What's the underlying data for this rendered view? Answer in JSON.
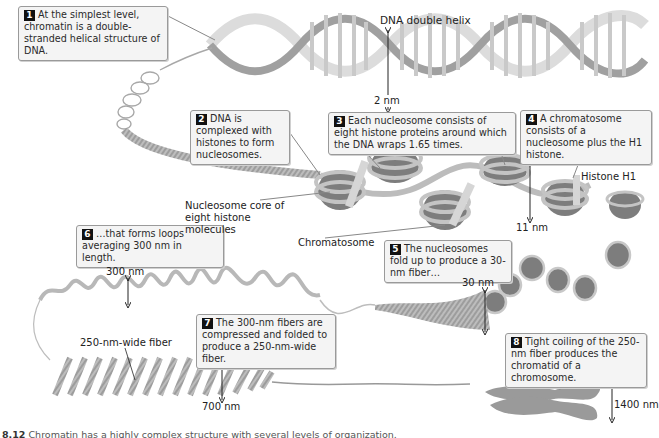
{
  "figure": {
    "caption_number": "8.12",
    "caption_text": "Chromatin has a highly complex structure with several levels of organization."
  },
  "callouts": [
    {
      "step": "1",
      "text": "At the simplest level, chromatin is a double-stranded helical structure of DNA."
    },
    {
      "step": "2",
      "text": "DNA is complexed with histones to form nucleosomes."
    },
    {
      "step": "3",
      "text": "Each nucleosome consists of eight histone proteins around which the DNA wraps 1.65 times."
    },
    {
      "step": "4",
      "text": "A chromatosome consists of a nucleosome plus the H1 histone."
    },
    {
      "step": "5",
      "text": "The nucleosomes fold up to produce a 30-nm fiber…"
    },
    {
      "step": "6",
      "text": "…that forms loops averaging 300 nm in length."
    },
    {
      "step": "7",
      "text": "The 300-nm fibers are compressed and folded to produce a 250-nm-wide fiber."
    },
    {
      "step": "8",
      "text": "Tight coiling of the 250-nm fiber produces the chromatid of a chromosome."
    }
  ],
  "labels": {
    "dna_double_helix": "DNA double helix",
    "nm_2": "2 nm",
    "nm_11": "11 nm",
    "histone_h1": "Histone H1",
    "nucleosome_core": "Nucleosome core of eight histone molecules",
    "chromatosome": "Chromatosome",
    "nm_30": "30 nm",
    "nm_300": "300 nm",
    "fiber_250": "250-nm-wide fiber",
    "nm_700": "700 nm",
    "nm_1400": "1400 nm"
  },
  "colors": {
    "helix_light": "#d9d9d9",
    "helix_dark": "#8c8c8c",
    "histone_dark": "#7a7a7a",
    "histone_light": "#c8c8c8",
    "callout_bg": "#f4f4f4",
    "badge_bg": "#111111",
    "chromosome": "#9a9a9a"
  }
}
